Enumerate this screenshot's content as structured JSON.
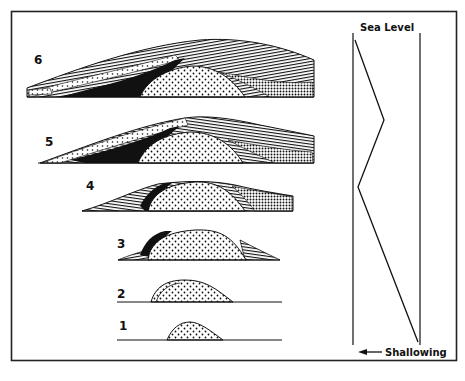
{
  "figure": {
    "type": "geologic cross-section evolution diagram",
    "frame_color": "#222222",
    "ink_color": "#111111",
    "background": "#ffffff"
  },
  "stages": [
    {
      "id": "1",
      "label": "1"
    },
    {
      "id": "2",
      "label": "2"
    },
    {
      "id": "3",
      "label": "3"
    },
    {
      "id": "4",
      "label": "4"
    },
    {
      "id": "5",
      "label": "5"
    },
    {
      "id": "6",
      "label": "6"
    }
  ],
  "legend_patterns": {
    "core": "dotted (reef/mound core)",
    "flank": "horizontal lines (bedded flank strata)",
    "black": "solid black (shale/organic facies)",
    "dense_dots": "dense dot stipple (basinal facies)",
    "open_dots": "sparse dots (grainstone cap)"
  },
  "sea_level_panel": {
    "title": "Sea Level",
    "axis_label": "Shallowing",
    "arrow": "left-arrow",
    "curve_points": [
      [
        355,
        40
      ],
      [
        384,
        120
      ],
      [
        358,
        187
      ],
      [
        418,
        342
      ]
    ]
  }
}
